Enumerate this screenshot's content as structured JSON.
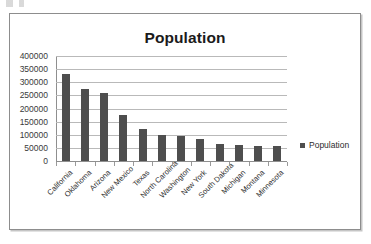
{
  "chart_data": {
    "type": "bar",
    "title": "Population",
    "xlabel": "",
    "ylabel": "",
    "ylim": [
      0,
      400000
    ],
    "ytick_step": 50000,
    "yticks": [
      "400000",
      "350000",
      "300000",
      "250000",
      "200000",
      "150000",
      "100000",
      "50000",
      "0"
    ],
    "grid": true,
    "legend_position": "right",
    "categories": [
      "California",
      "Oklahoma",
      "Arizona",
      "New Mexico",
      "Texas",
      "North Carolina",
      "Washington",
      "New York",
      "South Dakota",
      "Michigan",
      "Montana",
      "Minnesota"
    ],
    "series": [
      {
        "name": "Population",
        "color": "#4e4e4e",
        "values": [
          333000,
          275000,
          258000,
          174000,
          121000,
          101000,
          96000,
          83000,
          63000,
          60000,
          57000,
          58000
        ]
      }
    ]
  },
  "legend": {
    "items": [
      {
        "label": "Population",
        "color": "#4e4e4e"
      }
    ]
  }
}
